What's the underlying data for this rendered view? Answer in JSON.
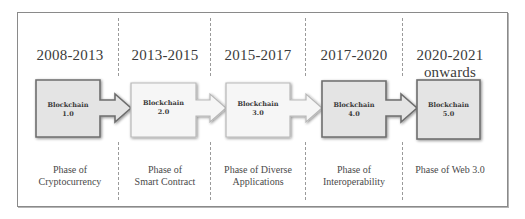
{
  "diagram": {
    "phases": [
      {
        "period": "2008-2013",
        "block_title": "Blockchain",
        "block_version": "1.0",
        "description_line1": "Phase of",
        "description_line2": "Cryptocurrency"
      },
      {
        "period": "2013-2015",
        "block_title": "Blockchain",
        "block_version": "2.0",
        "description_line1": "Phase of",
        "description_line2": "Smart Contract"
      },
      {
        "period": "2015-2017",
        "block_title": "Blockchain",
        "block_version": "3.0",
        "description_line1": "Phase of Diverse",
        "description_line2": "Applications"
      },
      {
        "period": "2017-2020",
        "block_title": "Blockchain",
        "block_version": "4.0",
        "description_line1": "Phase of",
        "description_line2": "Interoperability"
      },
      {
        "period_line1": "2020-2021",
        "period_line2": "onwards",
        "block_title": "Blockchain",
        "block_version": "5.0",
        "description_line1": "Phase of Web 3.0"
      }
    ],
    "colors": {
      "frame_border": "#8a8a8a",
      "dark_block_fill": "#e4e4e4",
      "dark_block_border": "#6e6e6e",
      "light_block_fill": "#f6f6f6",
      "light_block_border": "#b8b8b8",
      "divider": "#9a9a9a",
      "text": "#3a3a3a"
    }
  }
}
